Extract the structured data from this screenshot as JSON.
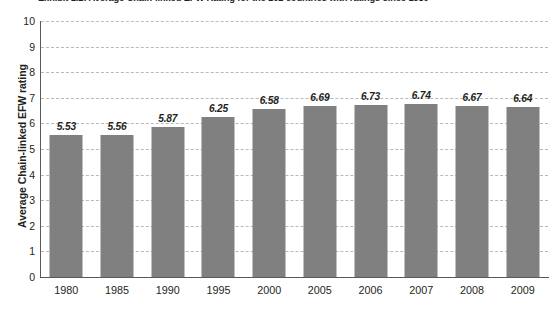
{
  "chart_data": {
    "type": "bar",
    "title": "Exhibit 1.2: Average Chain-linked EFW Rating for the 102 countries with ratings since 1980",
    "xlabel": "",
    "ylabel": "Average Chain-linked EFW rating",
    "categories": [
      "1980",
      "1985",
      "1990",
      "1995",
      "2000",
      "2005",
      "2006",
      "2007",
      "2008",
      "2009"
    ],
    "values": [
      5.53,
      5.56,
      5.87,
      6.25,
      6.58,
      6.69,
      6.73,
      6.74,
      6.67,
      6.64
    ],
    "value_labels": [
      "5.53",
      "5.56",
      "5.87",
      "6.25",
      "6.58",
      "6.69",
      "6.73",
      "6.74",
      "6.67",
      "6.64"
    ],
    "ylim": [
      0,
      10
    ],
    "ytick_labels": [
      "0",
      "1",
      "2",
      "3",
      "4",
      "5",
      "6",
      "7",
      "8",
      "9",
      "10"
    ],
    "ytick_values": [
      0,
      1,
      2,
      3,
      4,
      5,
      6,
      7,
      8,
      9,
      10
    ],
    "grid": "horizontal-dashed",
    "legend": "none",
    "bar_color": "#808080",
    "gridline_color": "#b9b9b9",
    "axis_color": "#58595b",
    "text_color": "#231f20",
    "background_color": "#ffffff"
  }
}
